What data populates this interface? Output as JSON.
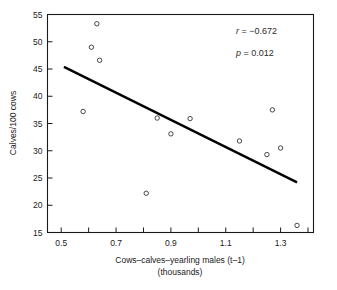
{
  "chart_data": {
    "type": "scatter",
    "title": "",
    "xlabel": "Cows–calves–yearling males (t–1)",
    "xlabel_sub": "(thousands)",
    "ylabel": "Calves/100 cows",
    "xlim": [
      0.45,
      1.42
    ],
    "ylim": [
      15,
      55
    ],
    "grid": false,
    "legend": null,
    "x_major_ticks": [
      0.5,
      0.7,
      0.9,
      1.1,
      1.3
    ],
    "x_major_tick_labels": [
      "0.5",
      "0.7",
      "0.9",
      "1.1",
      "1.3"
    ],
    "x_minor_ticks": [
      0.6,
      0.8,
      1.0,
      1.2,
      1.4
    ],
    "y_ticks": [
      15,
      20,
      25,
      30,
      35,
      40,
      45,
      50,
      55
    ],
    "y_tick_labels": [
      "15",
      "20",
      "25",
      "30",
      "35",
      "40",
      "45",
      "50",
      "55"
    ],
    "points": [
      {
        "x": 0.58,
        "y": 37.2
      },
      {
        "x": 0.61,
        "y": 49.0
      },
      {
        "x": 0.63,
        "y": 53.3
      },
      {
        "x": 0.64,
        "y": 46.6
      },
      {
        "x": 0.81,
        "y": 22.2
      },
      {
        "x": 0.85,
        "y": 36.0
      },
      {
        "x": 0.9,
        "y": 33.1
      },
      {
        "x": 0.97,
        "y": 35.9
      },
      {
        "x": 1.15,
        "y": 31.8
      },
      {
        "x": 1.25,
        "y": 29.3
      },
      {
        "x": 1.27,
        "y": 37.5
      },
      {
        "x": 1.3,
        "y": 30.5
      },
      {
        "x": 1.36,
        "y": 16.3
      }
    ],
    "fit_line": {
      "x0": 0.51,
      "y0": 45.4,
      "x1": 1.36,
      "y1": 24.2
    },
    "annotations": [
      {
        "name": "correlation",
        "label": "r",
        "separator": " = ",
        "value": "−0.672"
      },
      {
        "name": "p-value",
        "label": "p",
        "separator": " = ",
        "value": "0.012"
      }
    ]
  },
  "annotation_r_text": "r = −0.672",
  "annotation_p_text": "p = 0.012",
  "marker": {
    "shape": "open-circle",
    "radius": 2.2,
    "stroke_color": "#333333"
  },
  "colors": {
    "axis": "#1a1a1a",
    "line": "#000000",
    "marker": "#333333",
    "background": "#ffffff"
  }
}
